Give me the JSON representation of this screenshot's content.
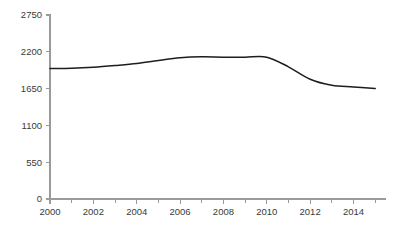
{
  "chart_data": {
    "type": "line",
    "title": "",
    "subtitle": "",
    "xlabel": "",
    "ylabel": "",
    "xlim": [
      2000,
      2015.5
    ],
    "ylim": [
      0,
      2750
    ],
    "grid": false,
    "legend": false,
    "legend_position": "none",
    "x": [
      2000,
      2001,
      2002,
      2003,
      2004,
      2005,
      2006,
      2007,
      2008,
      2009,
      2010,
      2011,
      2012,
      2013,
      2014,
      2015
    ],
    "series": [
      {
        "name": "value",
        "color": "#1d1d1d",
        "values": [
          1950,
          1955,
          1970,
          1995,
          2025,
          2070,
          2110,
          2125,
          2120,
          2120,
          2120,
          1975,
          1790,
          1700,
          1675,
          1650
        ]
      }
    ],
    "y_ticks": [
      0,
      550,
      1100,
      1650,
      2200,
      2750
    ],
    "y_tick_labels": [
      "0",
      "550",
      "1100",
      "1650",
      "2200",
      "2750"
    ],
    "x_ticks": [
      2000,
      2001,
      2002,
      2003,
      2004,
      2005,
      2006,
      2007,
      2008,
      2009,
      2010,
      2011,
      2012,
      2013,
      2014,
      2015
    ],
    "x_tick_labels_major": [
      "2000",
      "2002",
      "2004",
      "2006",
      "2008",
      "2010",
      "2012",
      "2014"
    ],
    "x_ticks_major": [
      2000,
      2002,
      2004,
      2006,
      2008,
      2010,
      2012,
      2014
    ],
    "axis_color": "#9a9a9a",
    "label_color": "#3a3a3a",
    "background_color": "#ffffff"
  }
}
